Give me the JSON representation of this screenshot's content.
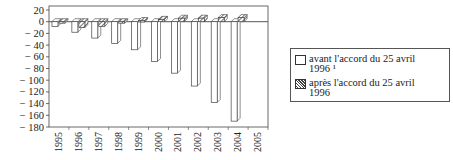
{
  "chart_data": {
    "type": "bar",
    "title": "",
    "xlabel": "",
    "ylabel": "",
    "ylim": [
      -180,
      20
    ],
    "yticks": [
      20,
      0,
      -20,
      -40,
      -60,
      -80,
      -100,
      -120,
      -140,
      -160,
      -180
    ],
    "categories": [
      "1995",
      "1996",
      "1997",
      "1998",
      "1999",
      "2000",
      "2001",
      "2002",
      "2003",
      "2004",
      "2005"
    ],
    "series": [
      {
        "name": "avant l'accord du 25 avril 1996 ¹",
        "pattern": "white",
        "values": [
          -8,
          -18,
          -28,
          -37,
          -48,
          -68,
          -88,
          -110,
          -138,
          -170,
          null
        ]
      },
      {
        "name": "après l'accord du 25 avril 1996",
        "pattern": "hatched",
        "values": [
          -1,
          -10,
          -8,
          -2,
          2,
          4,
          6,
          6,
          7,
          7,
          null
        ]
      }
    ],
    "legend_position": "right",
    "grid": false,
    "style": "3d-bar"
  },
  "legend": {
    "item1_line1": "avant l'accord du 25 avril",
    "item1_line2": "1996 ¹",
    "item2_line1": "après l'accord du 25 avril",
    "item2_line2": "1996"
  }
}
